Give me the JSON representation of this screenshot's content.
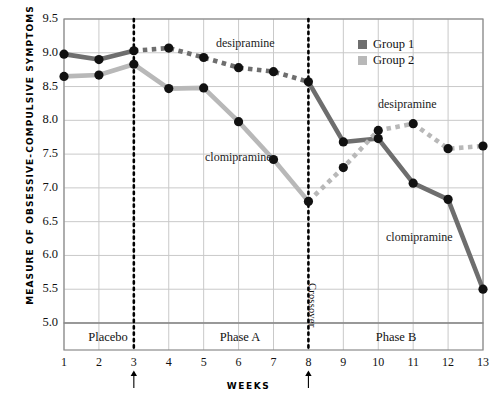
{
  "axis": {
    "y_title": "MEASURE OF OBSESSIVE-COMPULSIVE SYMPTOMS",
    "x_title": "WEEKS",
    "y_ticks": [
      "9.5",
      "9.0",
      "8.5",
      "8.0",
      "7.5",
      "7.0",
      "6.5",
      "6.0",
      "5.5",
      "5.0"
    ],
    "x_ticks": [
      "1",
      "2",
      "3",
      "4",
      "5",
      "6",
      "7",
      "8",
      "9",
      "10",
      "11",
      "12",
      "13"
    ]
  },
  "legend": {
    "items": [
      {
        "label": "Group 1",
        "color": "#6e6e6e"
      },
      {
        "label": "Group 2",
        "color": "#b8b8b8"
      }
    ]
  },
  "phases": [
    {
      "name": "Placebo"
    },
    {
      "name": "Phase A"
    },
    {
      "name": "Phase B"
    }
  ],
  "annotations": {
    "crossover": "Crossover",
    "desipramine_top": "desipramine",
    "clomipramine_left": "clomipramine",
    "desipramine_right": "desipramine",
    "clomipramine_right": "clomipramine"
  },
  "chart_data": {
    "type": "line",
    "title": "",
    "xlabel": "WEEKS",
    "ylabel": "MEASURE OF OBSESSIVE-COMPULSIVE SYMPTOMS",
    "xlim": [
      1,
      13
    ],
    "ylim": [
      5.0,
      9.5
    ],
    "grid": true,
    "legend_position": "top-right",
    "x": [
      1,
      2,
      3,
      4,
      5,
      6,
      7,
      8,
      9,
      10,
      11,
      12,
      13
    ],
    "series": [
      {
        "name": "Group 1",
        "color": "#6e6e6e",
        "values": [
          8.98,
          8.9,
          9.03,
          9.07,
          8.93,
          8.78,
          8.72,
          8.57,
          7.68,
          7.73,
          7.07,
          6.83,
          5.5
        ],
        "segments": [
          {
            "drug": "placebo",
            "style": "solid",
            "from": 1,
            "to": 3
          },
          {
            "drug": "desipramine",
            "style": "dotted",
            "from": 3,
            "to": 8
          },
          {
            "drug": "clomipramine",
            "style": "solid",
            "from": 8,
            "to": 13
          }
        ]
      },
      {
        "name": "Group 2",
        "color": "#b8b8b8",
        "values": [
          8.65,
          8.67,
          8.83,
          8.47,
          8.48,
          7.98,
          7.42,
          6.8,
          7.3,
          7.85,
          7.95,
          7.58,
          7.62
        ],
        "segments": [
          {
            "drug": "placebo",
            "style": "solid",
            "from": 1,
            "to": 3
          },
          {
            "drug": "clomipramine",
            "style": "solid",
            "from": 3,
            "to": 8
          },
          {
            "drug": "desipramine",
            "style": "dotted",
            "from": 8,
            "to": 13
          }
        ]
      }
    ],
    "vertical_markers": [
      {
        "x": 3,
        "label": ""
      },
      {
        "x": 8,
        "label": "Crossover"
      }
    ]
  }
}
